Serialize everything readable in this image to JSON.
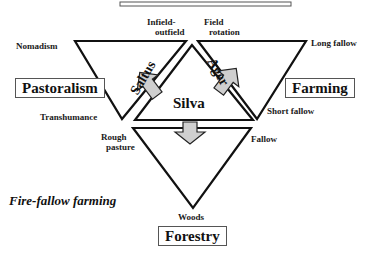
{
  "diagram": {
    "colors": {
      "line": "#111111",
      "arrow_fill": "#cfcfcf",
      "arrow_stroke": "#222222",
      "box_border": "#555555",
      "background": "#ffffff"
    },
    "center": {
      "main": "Silva",
      "left_side": "Saltus",
      "right_side": "Ager"
    },
    "categories": {
      "pastoralism": "Pastoralism",
      "farming": "Farming",
      "forestry": "Forestry"
    },
    "labels": {
      "nomadism": "Nomadism",
      "transhumance": "Transhumance",
      "infield_outfield_1": "Infield-",
      "infield_outfield_2": "outfield",
      "field_rotation_1": "Field",
      "field_rotation_2": "rotation",
      "long_fallow": "Long  fallow",
      "short_fallow": "Short  fallow",
      "rough_pasture_1": "Rough",
      "rough_pasture_2": "pasture",
      "fallow": "Fallow",
      "woods": "Woods"
    },
    "side_title": "Fire-fallow farming"
  }
}
